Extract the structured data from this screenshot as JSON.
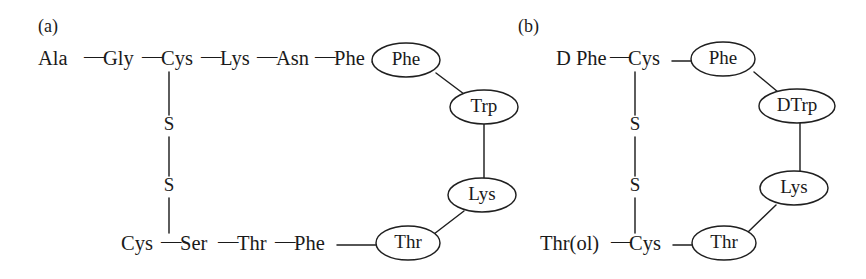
{
  "figure": {
    "background_color": "#ffffff",
    "stroke_color": "#1f1f1f",
    "text_color": "#1a1a1a"
  },
  "panels": [
    {
      "id": "panel-a",
      "label": "(a)",
      "chain_top": {
        "residues": [
          "Ala",
          "Gly",
          "Cys",
          "Lys",
          "Asn",
          "Phe"
        ],
        "separator": "—"
      },
      "chain_bottom": {
        "residues": [
          "Cys",
          "Ser",
          "Thr",
          "Phe"
        ],
        "separator": "—"
      },
      "bridge": {
        "atoms": [
          "S",
          "S"
        ],
        "label": "disulfide-bridge"
      },
      "ring_nodes": [
        {
          "label": "Phe",
          "name": "node-phe"
        },
        {
          "label": "Trp",
          "name": "node-trp"
        },
        {
          "label": "Lys",
          "name": "node-lys"
        },
        {
          "label": "Thr",
          "name": "node-thr"
        }
      ]
    },
    {
      "id": "panel-b",
      "label": "(b)",
      "chain_top": {
        "residues": [
          "D Phe",
          "Cys"
        ],
        "separator": "—"
      },
      "chain_bottom": {
        "residues": [
          "Thr(ol)",
          "Cys"
        ],
        "separator": "—"
      },
      "bridge": {
        "atoms": [
          "S",
          "S"
        ],
        "label": "disulfide-bridge"
      },
      "ring_nodes": [
        {
          "label": "Phe",
          "name": "node-phe"
        },
        {
          "label": "DTrp",
          "name": "node-dtrp"
        },
        {
          "label": "Lys",
          "name": "node-lys"
        },
        {
          "label": "Thr",
          "name": "node-thr"
        }
      ]
    }
  ]
}
